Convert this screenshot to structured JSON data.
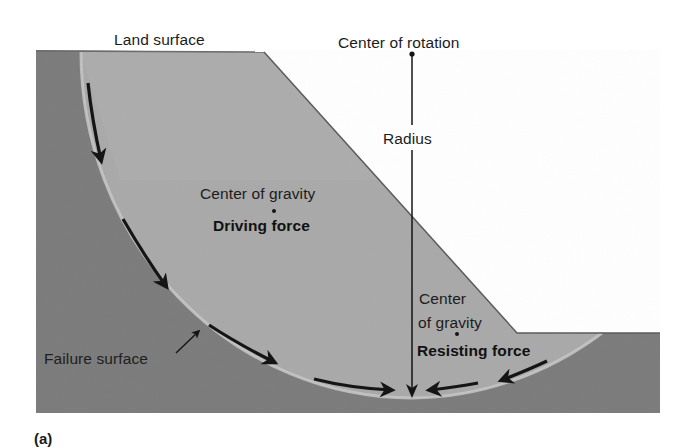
{
  "figure": {
    "panel_label": "(a)",
    "colors": {
      "background": "#ffffff",
      "bedrock": "#7b7b7b",
      "slide_mass": "#a9a9a9",
      "slide_mass_upper": "#b4b4b4",
      "failure_surface_edge": "#c9c9c9",
      "ink": "#1a1a1a"
    },
    "labels": {
      "land_surface": "Land surface",
      "center_of_rotation": "Center of rotation",
      "radius": "Radius",
      "cog_driving_title": "Center of gravity",
      "driving_force": "Driving force",
      "cog_resisting_line1": "Center",
      "cog_resisting_line2": "of gravity",
      "resisting_force": "Resisting force",
      "failure_surface": "Failure surface"
    },
    "geometry": {
      "rotation_center": [
        412,
        53
      ],
      "radius_endpoint": [
        412,
        398
      ],
      "slope_top": [
        264,
        52
      ],
      "slope_toe": [
        517,
        333
      ],
      "bench_level_y": 333,
      "ground_top_y": 50,
      "bottom_y": 413,
      "left_x": 36,
      "right_x": 660
    },
    "arrows": [
      {
        "name": "rotation-arrow-1",
        "direction": "down"
      },
      {
        "name": "rotation-arrow-2",
        "direction": "down-right"
      },
      {
        "name": "rotation-arrow-3",
        "direction": "down-right"
      },
      {
        "name": "rotation-arrow-4",
        "direction": "right"
      },
      {
        "name": "rotation-arrow-5",
        "direction": "left"
      },
      {
        "name": "rotation-arrow-6",
        "direction": "down-left"
      }
    ]
  }
}
